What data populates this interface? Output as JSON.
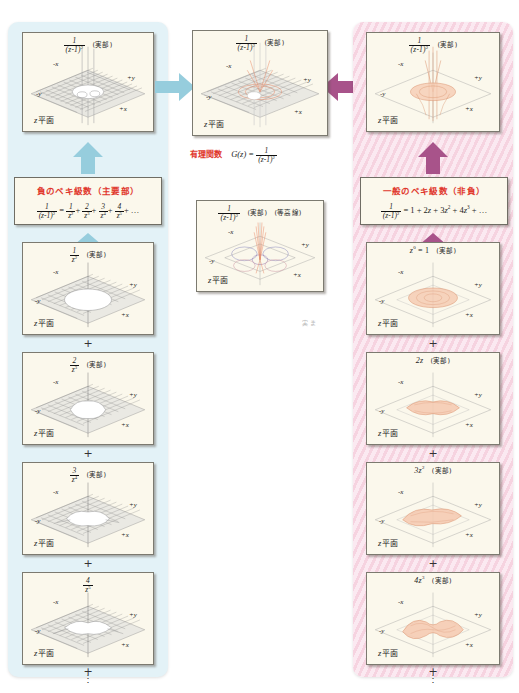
{
  "figure": {
    "plane_label": "z 平面",
    "real_part_tag": "(実部)",
    "contour_tag": "(等高線)",
    "axis_labels": {
      "neg_x": "-x",
      "pos_x": "+x",
      "neg_y": "-y",
      "pos_y": "+y",
      "origin": "0"
    }
  },
  "center": {
    "top_panel_caption_num": "1",
    "top_panel_caption_den": "(z-1)",
    "top_panel_caption_den_exp": "2",
    "rational_label": "有理関数",
    "rational_expr_lhs": "G(z) =",
    "rational_expr_num": "1",
    "rational_expr_den": "(z-1)",
    "rational_expr_den_exp": "2",
    "contour_panel_tag": "(等高線)"
  },
  "left_column": {
    "accent_color": "#e3f2f7",
    "arrow_color": "#96cddd",
    "formula_title": "負のベキ級数（主要部）",
    "formula_lhs_num": "1",
    "formula_lhs_den": "(z-1)",
    "formula_lhs_den_exp": "2",
    "formula_rhs": "= 1/z² + 2/z³ + 3/z⁴ + 4/z⁵ + …",
    "top_panel": {
      "num": "1",
      "den": "(z-1)",
      "den_exp": "2"
    },
    "terms": [
      {
        "num": "1",
        "den": "z",
        "den_exp": "2"
      },
      {
        "num": "2",
        "den": "z",
        "den_exp": "3"
      },
      {
        "num": "3",
        "den": "z",
        "den_exp": "4"
      },
      {
        "num": "4",
        "den": "z",
        "den_exp": "5"
      }
    ],
    "plus": "+",
    "ellipsis": "⋮"
  },
  "right_column": {
    "accent_color": "#f6d3e0",
    "arrow_color": "#a8538a",
    "formula_title": "一般のベキ級数（非負）",
    "formula_lhs_num": "1",
    "formula_lhs_den": "(z-1)",
    "formula_lhs_den_exp": "2",
    "formula_rhs": "= 1 + 2z + 3z² + 4z³ + …",
    "top_panel": {
      "num": "1",
      "den": "(z-1)",
      "den_exp": "2"
    },
    "terms": [
      {
        "label": "z",
        "exp": "0",
        "suffix": " = 1"
      },
      {
        "label": "2z",
        "exp": "",
        "suffix": ""
      },
      {
        "label": "3z",
        "exp": "2",
        "suffix": ""
      },
      {
        "label": "4z",
        "exp": "3",
        "suffix": ""
      }
    ],
    "plus": "+",
    "ellipsis": "⋮"
  },
  "arrows": {
    "left_to_center": "arrow-right-blue",
    "right_to_center": "arrow-left-magenta",
    "left_up": "arrow-up-blue",
    "right_up": "arrow-up-magenta"
  }
}
